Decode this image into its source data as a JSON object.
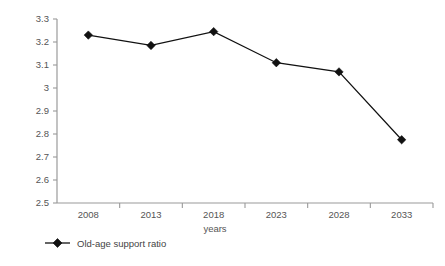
{
  "chart_data": {
    "type": "line",
    "title": "",
    "subtitle": "",
    "xlabel": "years",
    "ylabel": "",
    "categories": [
      "2008",
      "2013",
      "2018",
      "2023",
      "2028",
      "2033"
    ],
    "series": [
      {
        "name": "Old-age support ratio",
        "values": [
          3.23,
          3.185,
          3.245,
          3.11,
          3.07,
          2.775
        ],
        "marker": "diamond",
        "color": "#111111"
      }
    ],
    "ylim": [
      2.5,
      3.3
    ],
    "ytick_step": 0.1,
    "ytick_labels": [
      "3.3",
      "3.2",
      "3.1",
      "3",
      "2.9",
      "2.8",
      "2.7",
      "2.6",
      "2.5"
    ],
    "ytick_values": [
      3.3,
      3.2,
      3.1,
      3.0,
      2.9,
      2.8,
      2.7,
      2.6,
      2.5
    ],
    "grid": false,
    "legend_position": "bottom-left",
    "background_color": "#ffffff",
    "axis_color": "#9a9a9a",
    "text_color": "#555555"
  },
  "axis": {
    "x_title": "years"
  },
  "legend": {
    "entries": [
      {
        "label": "Old-age support ratio",
        "marker": "diamond-marker-icon"
      }
    ]
  }
}
